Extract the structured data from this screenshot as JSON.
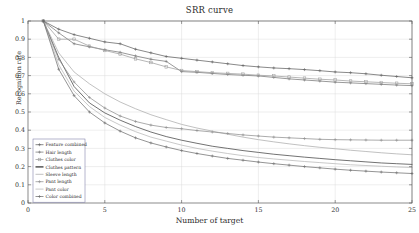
{
  "chart_data": {
    "type": "line",
    "title": "SRR curve",
    "xlabel": "Number of target",
    "ylabel": "Recognition rate",
    "xlim": [
      0,
      25
    ],
    "ylim": [
      0,
      1
    ],
    "xticks": [
      0,
      5,
      10,
      15,
      20,
      25
    ],
    "xtick_labels": [
      "0",
      "5",
      "10",
      "15",
      "20",
      "25"
    ],
    "yticks": [
      0,
      0.1,
      0.2,
      0.3,
      0.4,
      0.5,
      0.6,
      0.7,
      0.8,
      0.9,
      1
    ],
    "ytick_labels": [
      "0",
      "0.1",
      "0.2",
      "0.3",
      "0.4",
      "0.5",
      "0.6",
      "0.7",
      "0.8",
      "0.9",
      "1"
    ],
    "grid": true,
    "legend_position": "lower-left",
    "x": [
      1,
      2,
      3,
      4,
      5,
      6,
      7,
      8,
      9,
      10,
      11,
      12,
      13,
      14,
      15,
      16,
      17,
      18,
      19,
      20,
      21,
      22,
      23,
      24,
      25
    ],
    "series": [
      {
        "name": "Feature combined",
        "color": "#5b5b5b",
        "marker": "plus",
        "values": [
          1.0,
          0.955,
          0.925,
          0.905,
          0.885,
          0.875,
          0.845,
          0.825,
          0.805,
          0.795,
          0.785,
          0.775,
          0.765,
          0.755,
          0.748,
          0.742,
          0.738,
          0.733,
          0.727,
          0.72,
          0.716,
          0.71,
          0.702,
          0.695,
          0.688
        ]
      },
      {
        "name": "Hair length",
        "color": "#717171",
        "marker": "plus",
        "values": [
          1.0,
          0.935,
          0.875,
          0.858,
          0.842,
          0.828,
          0.808,
          0.79,
          0.778,
          0.722,
          0.718,
          0.712,
          0.706,
          0.702,
          0.698,
          0.69,
          0.682,
          0.676,
          0.67,
          0.664,
          0.66,
          0.656,
          0.652,
          0.648,
          0.645
        ]
      },
      {
        "name": "Clothes color",
        "color": "#9a9a9a",
        "marker": "square",
        "values": [
          1.0,
          0.9,
          0.9,
          0.862,
          0.838,
          0.818,
          0.792,
          0.772,
          0.748,
          0.728,
          0.722,
          0.716,
          0.712,
          0.708,
          0.702,
          0.698,
          0.692,
          0.686,
          0.68,
          0.676,
          0.67,
          0.666,
          0.662,
          0.658,
          0.655
        ]
      },
      {
        "name": "Clothes pattern",
        "color": "#3a3a3a",
        "marker": "none",
        "values": [
          1.0,
          0.8,
          0.64,
          0.55,
          0.495,
          0.455,
          0.42,
          0.39,
          0.365,
          0.345,
          0.328,
          0.312,
          0.3,
          0.288,
          0.278,
          0.268,
          0.26,
          0.252,
          0.245,
          0.238,
          0.232,
          0.226,
          0.22,
          0.216,
          0.212
        ]
      },
      {
        "name": "Sleeve length",
        "color": "#a8a8a8",
        "marker": "none",
        "values": [
          1.0,
          0.825,
          0.72,
          0.655,
          0.6,
          0.555,
          0.518,
          0.485,
          0.458,
          0.432,
          0.412,
          0.395,
          0.378,
          0.362,
          0.348,
          0.336,
          0.325,
          0.315,
          0.306,
          0.298,
          0.29,
          0.283,
          0.276,
          0.27,
          0.265
        ]
      },
      {
        "name": "Pant length",
        "color": "#8c8c8c",
        "marker": "plus",
        "values": [
          1.0,
          0.79,
          0.665,
          0.58,
          0.522,
          0.478,
          0.448,
          0.428,
          0.415,
          0.408,
          0.398,
          0.39,
          0.382,
          0.374,
          0.368,
          0.362,
          0.358,
          0.354,
          0.35,
          0.348,
          0.347,
          0.346,
          0.345,
          0.345,
          0.345
        ]
      },
      {
        "name": "Pant color",
        "color": "#b4b4b4",
        "marker": "none",
        "values": [
          1.0,
          0.76,
          0.615,
          0.53,
          0.47,
          0.428,
          0.392,
          0.362,
          0.34,
          0.318,
          0.3,
          0.285,
          0.272,
          0.26,
          0.25,
          0.242,
          0.235,
          0.228,
          0.222,
          0.216,
          0.21,
          0.206,
          0.202,
          0.198,
          0.195
        ]
      },
      {
        "name": "Color combined",
        "color": "#6a6a6a",
        "marker": "plus",
        "values": [
          1.0,
          0.735,
          0.59,
          0.5,
          0.44,
          0.395,
          0.358,
          0.33,
          0.308,
          0.288,
          0.272,
          0.258,
          0.245,
          0.235,
          0.225,
          0.216,
          0.208,
          0.2,
          0.193,
          0.186,
          0.18,
          0.175,
          0.17,
          0.166,
          0.162
        ]
      }
    ]
  }
}
